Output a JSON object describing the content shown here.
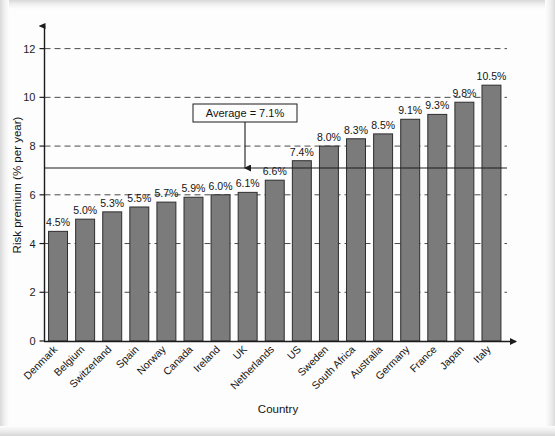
{
  "chart_data": {
    "type": "bar",
    "title": "",
    "xlabel": "Country",
    "ylabel": "Risk premium (% per year)",
    "categories": [
      "Denmark",
      "Belgium",
      "Switzerland",
      "Spain",
      "Norway",
      "Canada",
      "Ireland",
      "UK",
      "Netherlands",
      "US",
      "Sweden",
      "South Africa",
      "Australia",
      "Germany",
      "France",
      "Japan",
      "Italy"
    ],
    "values": [
      4.5,
      5.0,
      5.3,
      5.5,
      5.7,
      5.9,
      6.0,
      6.1,
      6.6,
      7.4,
      8.0,
      8.3,
      8.5,
      9.1,
      9.3,
      9.8,
      10.5
    ],
    "value_labels": [
      "4.5%",
      "5.0%",
      "5.3%",
      "5.5%",
      "5.7%",
      "5.9%",
      "6.0%",
      "6.1%",
      "6.6%",
      "7.4%",
      "8.0%",
      "8.3%",
      "8.5%",
      "9.1%",
      "9.3%",
      "9.8%",
      "10.5%"
    ],
    "ylim": [
      0,
      12.6
    ],
    "yticks": [
      0,
      2,
      4,
      6,
      8,
      10,
      12
    ],
    "ytick_labels": [
      "0",
      "2",
      "4",
      "6",
      "8",
      "10",
      "12"
    ],
    "grid": "horizontal-dashed",
    "legend": "none",
    "annotations": [
      {
        "name": "average-callout",
        "text": "Average = 7.1%",
        "value": 7.1,
        "style": "boxed-label-with-arrow",
        "reference_line": "solid"
      }
    ],
    "series_color": "#7b7b7b",
    "series_border_color": "#2e2e2e",
    "axis_color": "#1c1c1c",
    "gridline_color": "#4a4a4a"
  }
}
